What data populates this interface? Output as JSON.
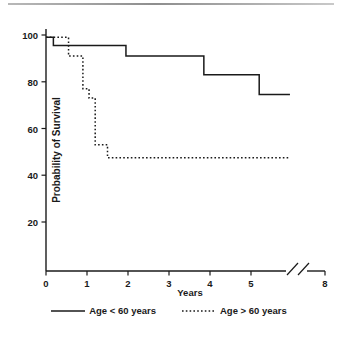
{
  "chart_data": {
    "type": "line",
    "title": "",
    "subtitle": "",
    "xlabel": "Years",
    "ylabel": "Probability of Survival",
    "xlim": [
      0,
      8
    ],
    "ylim": [
      0,
      105
    ],
    "x_ticks": [
      0,
      1,
      2,
      3,
      4,
      5,
      8
    ],
    "x_tick_labels": [
      "0",
      "1",
      "2",
      "3",
      "4",
      "5",
      "8"
    ],
    "y_ticks": [
      20,
      40,
      60,
      80,
      100
    ],
    "y_tick_labels": [
      "20",
      "40",
      "60",
      "80",
      "100"
    ],
    "grid": false,
    "axis_break": {
      "present": true,
      "between": [
        5.4,
        6.0
      ],
      "style": "double-slash"
    },
    "legend_position": "below",
    "series": [
      {
        "name": "Age < 60 years",
        "style": "solid",
        "color": "#1a1a1a",
        "step": "post",
        "x": [
          0.0,
          0.18,
          1.95,
          3.85,
          5.2,
          5.95
        ],
        "y": [
          99.0,
          95.5,
          91.0,
          83.0,
          74.5,
          74.5
        ],
        "points": [
          {
            "x": 0.0,
            "y": 99.0
          },
          {
            "x": 0.18,
            "y": 95.5
          },
          {
            "x": 1.95,
            "y": 91.0
          },
          {
            "x": 3.85,
            "y": 83.0
          },
          {
            "x": 5.2,
            "y": 74.5
          },
          {
            "x": 5.95,
            "y": 74.5
          }
        ]
      },
      {
        "name": "Age > 60 years",
        "style": "dotted",
        "color": "#1a1a1a",
        "step": "post",
        "x": [
          0.0,
          0.55,
          0.9,
          1.05,
          1.2,
          1.35,
          1.5,
          5.95
        ],
        "y": [
          99.0,
          91.0,
          77.0,
          73.0,
          53.0,
          53.0,
          47.5,
          47.5
        ],
        "points": [
          {
            "x": 0.0,
            "y": 99.0
          },
          {
            "x": 0.55,
            "y": 91.0
          },
          {
            "x": 0.9,
            "y": 77.0
          },
          {
            "x": 1.05,
            "y": 73.0
          },
          {
            "x": 1.2,
            "y": 53.0
          },
          {
            "x": 1.5,
            "y": 47.5
          },
          {
            "x": 5.95,
            "y": 47.5
          }
        ]
      }
    ]
  },
  "legend": {
    "items": [
      {
        "label": "Age < 60 years",
        "style": "solid"
      },
      {
        "label": "Age > 60 years",
        "style": "dotted"
      }
    ]
  },
  "axes": {
    "y_label": "Probability of Survival",
    "x_label": "Years"
  }
}
